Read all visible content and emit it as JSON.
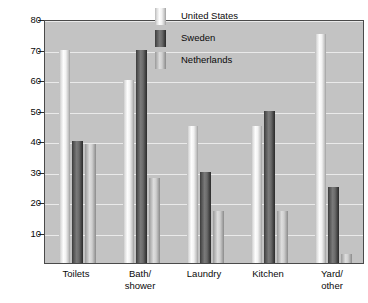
{
  "chart_data": {
    "type": "bar",
    "title": "",
    "subtitle": "",
    "xlabel": "",
    "ylabel": "Liters of water per person per day",
    "categories": [
      "Toilets",
      "Bath/ shower",
      "Laundry",
      "Kitchen",
      "Yard/ other"
    ],
    "category_lines": [
      [
        "Toilets"
      ],
      [
        "Bath/",
        "shower"
      ],
      [
        "Laundry"
      ],
      [
        "Kitchen"
      ],
      [
        "Yard/",
        "other"
      ]
    ],
    "series": [
      {
        "name": "United States",
        "values": [
          70,
          60,
          45,
          45,
          75
        ],
        "color": "#f2f2f2"
      },
      {
        "name": "Sweden",
        "values": [
          40,
          70,
          30,
          50,
          25
        ],
        "color": "#5a5a5a"
      },
      {
        "name": "Netherlands",
        "values": [
          39,
          28,
          17,
          17,
          3
        ],
        "color": "#cccccc"
      }
    ],
    "ylim": [
      0,
      80
    ],
    "yticks": [
      10,
      20,
      30,
      40,
      50,
      60,
      70,
      80
    ],
    "ytick_labels": [
      "10",
      "20",
      "30",
      "40",
      "50",
      "60",
      "70",
      "80"
    ],
    "grid": true,
    "legend_position": "top-center",
    "plot_background": "#c3c3c3",
    "grid_color": "#eaeaea",
    "axis_color": "#4a4a4a"
  }
}
